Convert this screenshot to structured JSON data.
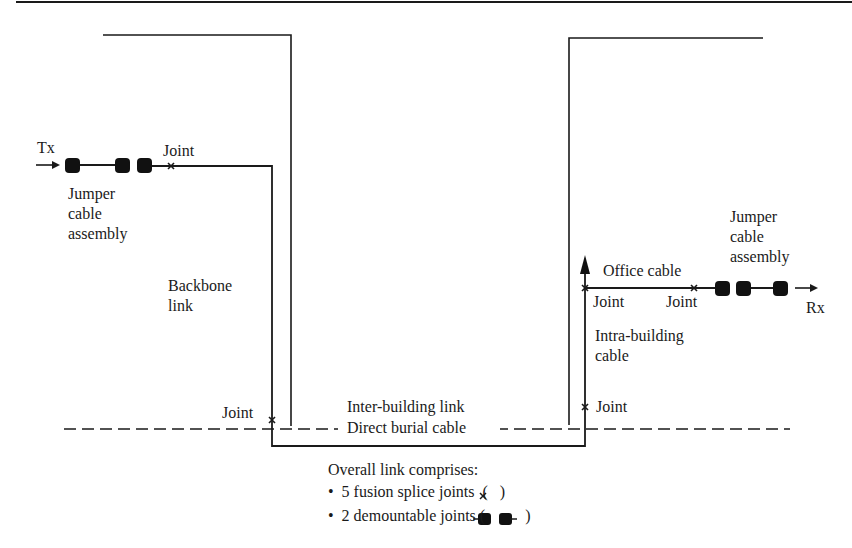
{
  "diagram": {
    "colors": {
      "line": "#1a1a1a",
      "background": "#ffffff"
    },
    "labels": {
      "tx": "Tx",
      "rx": "Rx",
      "joint_left_top": "Joint",
      "jumper_left": "Jumper\ncable\nassembly",
      "backbone": "Backbone\nlink",
      "joint_left_bottom": "Joint",
      "inter_building": "Inter-building link",
      "direct_burial": "Direct burial cable",
      "office_cable": "Office cable",
      "joint_right_1": "Joint",
      "joint_right_2": "Joint",
      "jumper_right": "Jumper\ncable\nassembly",
      "intra_building": "Intra-building\ncable",
      "joint_right_bottom": "Joint"
    },
    "legend": {
      "title": "Overall link comprises:",
      "items": [
        {
          "bullet": "•",
          "text": "5 fusion splice joints",
          "symbol": "(×)",
          "symbol_name": "fusion-splice-joint-icon"
        },
        {
          "bullet": "•",
          "text": "2 demountable joints",
          "symbol": "(connector pair)",
          "symbol_name": "demountable-joint-icon"
        }
      ]
    },
    "components": {
      "fusion_splice_joints": 5,
      "demountable_joints": 2
    }
  }
}
